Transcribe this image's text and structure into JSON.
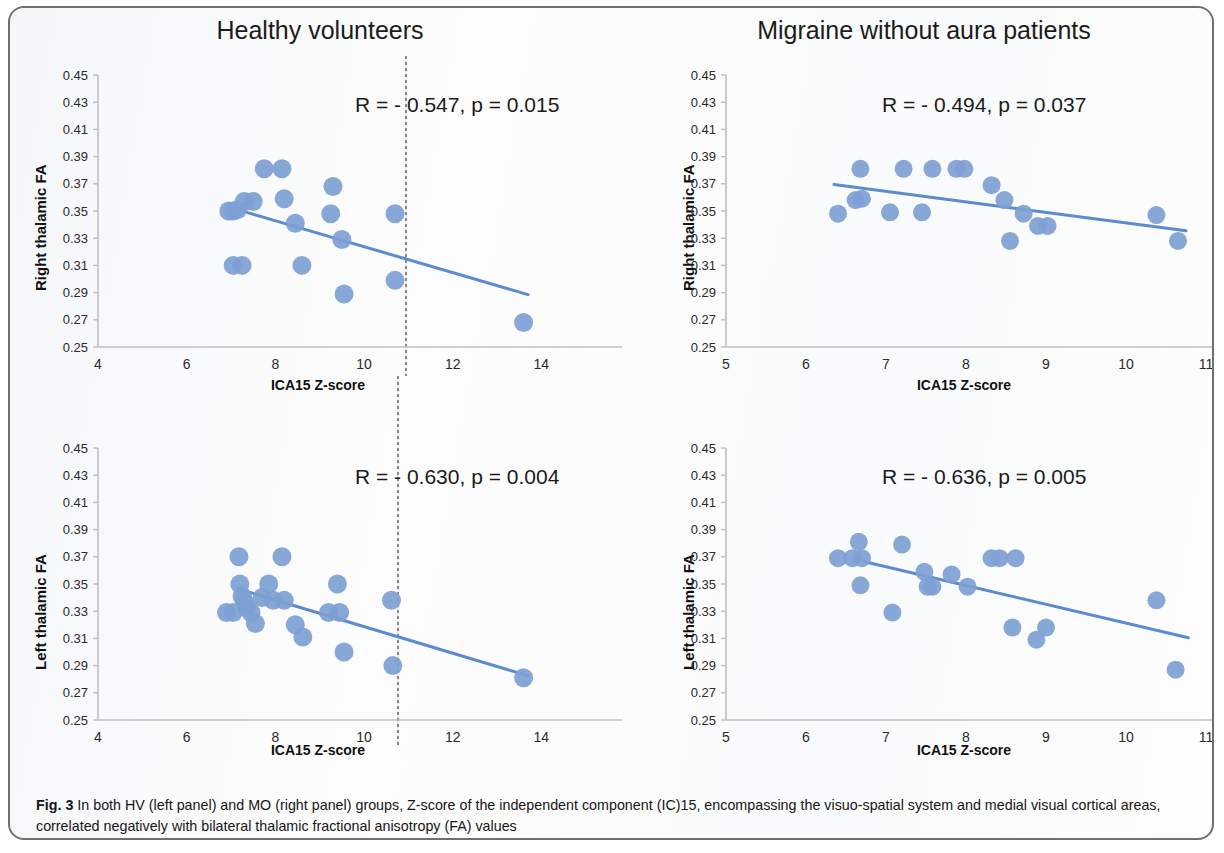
{
  "figure": {
    "label": "Fig. 3",
    "caption": " In both HV (left panel) and MO (right panel) groups, Z-score of the independent component (IC)15, encompassing the visuo-spatial system and medial visual cortical areas, correlated negatively with bilateral thalamic fractional anisotropy (FA) values",
    "marker_color": "#7da0d4",
    "trendline_color": "#5b8bd0",
    "axis_color": "#bfbfbf"
  },
  "titles": {
    "left": "Healthy volunteers",
    "right": "Migraine without aura patients"
  },
  "axis_titles": {
    "x": "ICA15 Z-score",
    "y_right_thalamic": "Right thalamic FA",
    "y_left_thalamic": "Left thalamic FA"
  },
  "chart_data": [
    {
      "id": "hv-right-thalamic",
      "type": "scatter",
      "title": "Healthy volunteers",
      "xlabel": "ICA15 Z-score",
      "ylabel": "Right thalamic FA",
      "xlim": [
        4,
        16
      ],
      "ylim": [
        0.25,
        0.45
      ],
      "xticks": [
        4,
        6,
        8,
        10,
        12,
        14,
        16
      ],
      "yticks": [
        0.25,
        0.27,
        0.29,
        0.31,
        0.33,
        0.35,
        0.37,
        0.39,
        0.41,
        0.43,
        0.45
      ],
      "ytick_labels": [
        "0.25",
        "0.27",
        "0.29",
        "0.31",
        "0.33",
        "0.35",
        "0.37",
        "0.39",
        "0.41",
        "0.43",
        "0.45"
      ],
      "xtick_labels": [
        "4",
        "6",
        "8",
        "10",
        "12",
        "14",
        "16"
      ],
      "grid": false,
      "annotation": "R = - 0.547, p = 0.015",
      "stats": {
        "R": -0.547,
        "p": 0.015
      },
      "points": [
        {
          "x": 6.95,
          "y": 0.35
        },
        {
          "x": 7.05,
          "y": 0.35
        },
        {
          "x": 7.15,
          "y": 0.351
        },
        {
          "x": 7.3,
          "y": 0.357
        },
        {
          "x": 7.5,
          "y": 0.357
        },
        {
          "x": 7.75,
          "y": 0.381
        },
        {
          "x": 8.15,
          "y": 0.381
        },
        {
          "x": 8.2,
          "y": 0.359
        },
        {
          "x": 7.05,
          "y": 0.31
        },
        {
          "x": 7.25,
          "y": 0.31
        },
        {
          "x": 8.45,
          "y": 0.341
        },
        {
          "x": 8.6,
          "y": 0.31
        },
        {
          "x": 9.3,
          "y": 0.368
        },
        {
          "x": 9.25,
          "y": 0.348
        },
        {
          "x": 9.5,
          "y": 0.329
        },
        {
          "x": 9.55,
          "y": 0.289
        },
        {
          "x": 10.7,
          "y": 0.348
        },
        {
          "x": 10.7,
          "y": 0.299
        },
        {
          "x": 13.6,
          "y": 0.268
        }
      ],
      "trendline": {
        "x1": 7.3,
        "y1": 0.3495,
        "x2": 13.7,
        "y2": 0.2885
      }
    },
    {
      "id": "mo-right-thalamic",
      "type": "scatter",
      "title": "Migraine without aura patients",
      "xlabel": "ICA15 Z-score",
      "ylabel": "Right thalamic FA",
      "xlim": [
        5,
        11
      ],
      "ylim": [
        0.25,
        0.45
      ],
      "xticks": [
        5,
        6,
        7,
        8,
        9,
        10,
        11
      ],
      "yticks": [
        0.25,
        0.27,
        0.29,
        0.31,
        0.33,
        0.35,
        0.37,
        0.39,
        0.41,
        0.43,
        0.45
      ],
      "ytick_labels": [
        "0.25",
        "0.27",
        "0.29",
        "0.31",
        "0.33",
        "0.35",
        "0.37",
        "0.39",
        "0.41",
        "0.43",
        "0.45"
      ],
      "xtick_labels": [
        "5",
        "6",
        "7",
        "8",
        "9",
        "10",
        "11"
      ],
      "grid": false,
      "annotation": "R = - 0.494, p = 0.037",
      "stats": {
        "R": -0.494,
        "p": 0.037
      },
      "points": [
        {
          "x": 6.4,
          "y": 0.348
        },
        {
          "x": 6.62,
          "y": 0.358
        },
        {
          "x": 6.7,
          "y": 0.359
        },
        {
          "x": 6.68,
          "y": 0.381
        },
        {
          "x": 7.05,
          "y": 0.349
        },
        {
          "x": 7.22,
          "y": 0.381
        },
        {
          "x": 7.45,
          "y": 0.349
        },
        {
          "x": 7.58,
          "y": 0.381
        },
        {
          "x": 7.88,
          "y": 0.381
        },
        {
          "x": 7.98,
          "y": 0.381
        },
        {
          "x": 8.32,
          "y": 0.369
        },
        {
          "x": 8.48,
          "y": 0.358
        },
        {
          "x": 8.55,
          "y": 0.328
        },
        {
          "x": 8.72,
          "y": 0.348
        },
        {
          "x": 8.9,
          "y": 0.339
        },
        {
          "x": 9.02,
          "y": 0.339
        },
        {
          "x": 10.38,
          "y": 0.347
        },
        {
          "x": 10.65,
          "y": 0.328
        }
      ],
      "trendline": {
        "x1": 6.35,
        "y1": 0.3695,
        "x2": 10.75,
        "y2": 0.3355
      }
    },
    {
      "id": "hv-left-thalamic",
      "type": "scatter",
      "title": "Healthy volunteers",
      "xlabel": "ICA15 Z-score",
      "ylabel": "Left thalamic FA",
      "xlim": [
        4,
        16
      ],
      "ylim": [
        0.25,
        0.45
      ],
      "xticks": [
        4,
        6,
        8,
        10,
        12,
        14,
        16
      ],
      "yticks": [
        0.25,
        0.27,
        0.29,
        0.31,
        0.33,
        0.35,
        0.37,
        0.39,
        0.41,
        0.43,
        0.45
      ],
      "ytick_labels": [
        "0.25",
        "0.27",
        "0.29",
        "0.31",
        "0.33",
        "0.35",
        "0.37",
        "0.39",
        "0.41",
        "0.43",
        "0.45"
      ],
      "xtick_labels": [
        "4",
        "6",
        "8",
        "10",
        "12",
        "14",
        "16"
      ],
      "grid": false,
      "annotation": "R = - 0.630, p = 0.004",
      "stats": {
        "R": -0.63,
        "p": 0.004
      },
      "points": [
        {
          "x": 6.9,
          "y": 0.329
        },
        {
          "x": 7.05,
          "y": 0.329
        },
        {
          "x": 7.18,
          "y": 0.37
        },
        {
          "x": 7.2,
          "y": 0.35
        },
        {
          "x": 7.25,
          "y": 0.341
        },
        {
          "x": 7.3,
          "y": 0.337
        },
        {
          "x": 7.35,
          "y": 0.333
        },
        {
          "x": 7.45,
          "y": 0.329
        },
        {
          "x": 7.55,
          "y": 0.321
        },
        {
          "x": 7.7,
          "y": 0.34
        },
        {
          "x": 7.85,
          "y": 0.35
        },
        {
          "x": 7.95,
          "y": 0.338
        },
        {
          "x": 8.15,
          "y": 0.37
        },
        {
          "x": 8.2,
          "y": 0.338
        },
        {
          "x": 8.45,
          "y": 0.32
        },
        {
          "x": 8.62,
          "y": 0.311
        },
        {
          "x": 9.2,
          "y": 0.329
        },
        {
          "x": 9.45,
          "y": 0.329
        },
        {
          "x": 9.4,
          "y": 0.35
        },
        {
          "x": 9.55,
          "y": 0.3
        },
        {
          "x": 10.62,
          "y": 0.338
        },
        {
          "x": 10.65,
          "y": 0.29
        },
        {
          "x": 13.6,
          "y": 0.281
        }
      ],
      "trendline": {
        "x1": 7.15,
        "y1": 0.3465,
        "x2": 13.7,
        "y2": 0.2825
      }
    },
    {
      "id": "mo-left-thalamic",
      "type": "scatter",
      "title": "Migraine without aura patients",
      "xlabel": "ICA15 Z-score",
      "ylabel": "Left thalamic FA",
      "xlim": [
        5,
        11
      ],
      "ylim": [
        0.25,
        0.45
      ],
      "xticks": [
        5,
        6,
        7,
        8,
        9,
        10,
        11
      ],
      "yticks": [
        0.25,
        0.27,
        0.29,
        0.31,
        0.33,
        0.35,
        0.37,
        0.39,
        0.41,
        0.43,
        0.45
      ],
      "ytick_labels": [
        "0.25",
        "0.27",
        "0.29",
        "0.31",
        "0.33",
        "0.35",
        "0.37",
        "0.39",
        "0.41",
        "0.43",
        "0.45"
      ],
      "xtick_labels": [
        "5",
        "6",
        "7",
        "8",
        "9",
        "10",
        "11"
      ],
      "grid": false,
      "annotation": "R = - 0.636, p = 0.005",
      "stats": {
        "R": -0.636,
        "p": 0.005
      },
      "points": [
        {
          "x": 6.4,
          "y": 0.369
        },
        {
          "x": 6.58,
          "y": 0.369
        },
        {
          "x": 6.66,
          "y": 0.381
        },
        {
          "x": 6.7,
          "y": 0.369
        },
        {
          "x": 6.68,
          "y": 0.349
        },
        {
          "x": 7.08,
          "y": 0.329
        },
        {
          "x": 7.2,
          "y": 0.379
        },
        {
          "x": 7.48,
          "y": 0.359
        },
        {
          "x": 7.52,
          "y": 0.348
        },
        {
          "x": 7.58,
          "y": 0.348
        },
        {
          "x": 7.82,
          "y": 0.357
        },
        {
          "x": 8.02,
          "y": 0.348
        },
        {
          "x": 8.32,
          "y": 0.369
        },
        {
          "x": 8.42,
          "y": 0.369
        },
        {
          "x": 8.62,
          "y": 0.369
        },
        {
          "x": 8.58,
          "y": 0.318
        },
        {
          "x": 8.88,
          "y": 0.309
        },
        {
          "x": 9.0,
          "y": 0.318
        },
        {
          "x": 10.38,
          "y": 0.338
        },
        {
          "x": 10.62,
          "y": 0.287
        }
      ],
      "trendline": {
        "x1": 6.72,
        "y1": 0.3665,
        "x2": 10.78,
        "y2": 0.3105
      }
    }
  ]
}
